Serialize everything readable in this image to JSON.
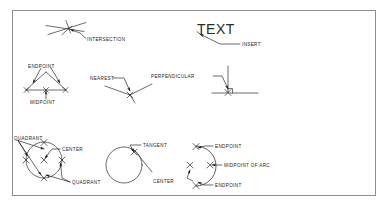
{
  "diagram": {
    "frame": {
      "border_color": "#8e8e8e",
      "background": "#ffffff"
    },
    "line_color": "#1a1a1a",
    "text_color": "#1a1a1a",
    "sample_text": "TEXT",
    "labels": {
      "intersection": "INTERSECTION",
      "insert": "INSERT",
      "endpoint_triangle": "ENDPOINT",
      "midpoint_triangle": "MIDPOINT",
      "nearest": "NEAREST",
      "perpendicular": "PERPENDICULAR",
      "quadrant_top": "QUADRANT",
      "quadrant_bottom": "QUADRANT",
      "center_circle": "CENTER",
      "tangent": "TANGENT",
      "endpoint_arc_top": "ENDPOINT",
      "midpoint_of_arc": "MIDPOINT OF ARC",
      "endpoint_arc_bottom": "ENDPOINT",
      "center_arc": "CENTER"
    }
  }
}
